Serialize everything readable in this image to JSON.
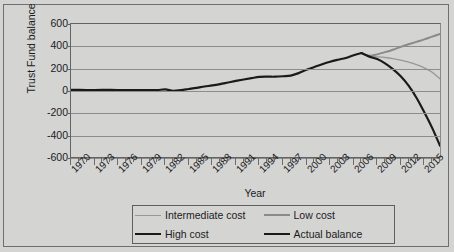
{
  "chart_data": {
    "type": "line",
    "title": "",
    "xlabel": "Year",
    "ylabel": "Trust Fund balance ($ billions)",
    "xlim": [
      1970,
      2017
    ],
    "ylim": [
      -600,
      600
    ],
    "grid": true,
    "legend_position": "bottom",
    "ytick_labels": [
      "600",
      "400",
      "200",
      "0",
      "-200",
      "-400",
      "-600"
    ],
    "ytick_values": [
      600,
      400,
      200,
      0,
      -200,
      -400,
      -600
    ],
    "xtick_labels": [
      "1970",
      "1973",
      "1976",
      "1979",
      "1982",
      "1985",
      "1988",
      "1991",
      "1994",
      "1997",
      "2000",
      "2003",
      "2006",
      "2009",
      "2012",
      "2015"
    ],
    "xtick_values": [
      1970,
      1973,
      1976,
      1979,
      1982,
      1985,
      1988,
      1991,
      1994,
      1997,
      2000,
      2003,
      2006,
      2009,
      2012,
      2015
    ],
    "minor_xtick_step": 1,
    "series": [
      {
        "name": "Actual balance",
        "color": "#1a1a1a",
        "width": 2.2,
        "x": [
          1970,
          1971,
          1972,
          1973,
          1974,
          1975,
          1976,
          1977,
          1978,
          1979,
          1980,
          1981,
          1982,
          1983,
          1984,
          1985,
          1986,
          1987,
          1988,
          1989,
          1990,
          1991,
          1992,
          1993,
          1994,
          1995,
          1996,
          1997,
          1998,
          1999,
          2000,
          2001,
          2002,
          2003,
          2004,
          2005,
          2006,
          2007
        ],
        "y": [
          10,
          10,
          9,
          9,
          10,
          10,
          9,
          8,
          7,
          8,
          9,
          8,
          14,
          2,
          8,
          18,
          28,
          40,
          50,
          62,
          76,
          90,
          103,
          115,
          126,
          128,
          128,
          132,
          138,
          160,
          190,
          215,
          240,
          262,
          280,
          296,
          320,
          340
        ]
      },
      {
        "name": "Low cost",
        "color": "#8a8a8a",
        "width": 2.0,
        "x": [
          2007,
          2008,
          2009,
          2010,
          2011,
          2012,
          2013,
          2014,
          2015,
          2016,
          2017
        ],
        "y": [
          340,
          316,
          328,
          348,
          370,
          395,
          418,
          440,
          462,
          487,
          510
        ]
      },
      {
        "name": "Intermediate cost",
        "color": "#989898",
        "width": 1.4,
        "x": [
          2007,
          2008,
          2009,
          2010,
          2011,
          2012,
          2013,
          2014,
          2015,
          2016,
          2017
        ],
        "y": [
          340,
          310,
          306,
          300,
          290,
          276,
          258,
          236,
          208,
          168,
          110
        ]
      },
      {
        "name": "High cost",
        "color": "#1a1a1a",
        "width": 2.2,
        "x": [
          2007,
          2008,
          2009,
          2010,
          2011,
          2012,
          2013,
          2014,
          2015,
          2016,
          2017
        ],
        "y": [
          340,
          308,
          286,
          248,
          196,
          132,
          48,
          -60,
          -190,
          -330,
          -490
        ]
      }
    ]
  },
  "legend": {
    "entries": [
      {
        "label": "Intermediate cost",
        "color": "#989898",
        "width": 1.4,
        "name": "intermediate-cost"
      },
      {
        "label": "Low cost",
        "color": "#8a8a8a",
        "width": 2.0,
        "name": "low-cost"
      },
      {
        "label": "High cost",
        "color": "#1a1a1a",
        "width": 2.4,
        "name": "high-cost"
      },
      {
        "label": "Actual balance",
        "color": "#1a1a1a",
        "width": 2.4,
        "name": "actual-balance"
      }
    ]
  },
  "colors": {
    "background": "#d4d4d3",
    "axis": "#636363",
    "gridline": "#8d8d8d",
    "text": "#1b1b1b"
  }
}
